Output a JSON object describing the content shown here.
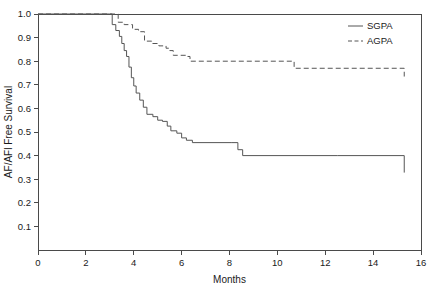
{
  "chart_data": {
    "type": "line",
    "title": "",
    "xlabel": "Months",
    "ylabel": "AF/AFl Free Survival",
    "xlim": [
      0,
      16
    ],
    "ylim": [
      0,
      1.0
    ],
    "grid": false,
    "legend_position": "top-right",
    "xticks": [
      0,
      2,
      4,
      6,
      8,
      10,
      12,
      14,
      16
    ],
    "xtick_labels": [
      "0",
      "2",
      "4",
      "6",
      "8",
      "10",
      "12",
      "14",
      "16"
    ],
    "yticks": [
      0.1,
      0.2,
      0.3,
      0.4,
      0.5,
      0.6,
      0.7,
      0.8,
      0.9,
      1.0
    ],
    "ytick_labels": [
      "0.1",
      "0.2",
      "0.3",
      "0.4",
      "0.5",
      "0.6",
      "0.7",
      "0.8",
      "0.9",
      "1.0"
    ],
    "series": [
      {
        "name": "SGPA",
        "style": "solid",
        "color": "#555555",
        "x": [
          0,
          3.0,
          3.1,
          3.25,
          3.4,
          3.5,
          3.6,
          3.7,
          3.8,
          3.9,
          4.0,
          4.1,
          4.25,
          4.4,
          4.55,
          4.8,
          5.0,
          5.2,
          5.4,
          5.55,
          5.8,
          6.0,
          6.2,
          6.45,
          8.1,
          8.35,
          8.55,
          12.5,
          15.3
        ],
        "y": [
          1.0,
          1.0,
          0.955,
          0.93,
          0.905,
          0.875,
          0.845,
          0.82,
          0.775,
          0.73,
          0.695,
          0.665,
          0.635,
          0.605,
          0.575,
          0.565,
          0.55,
          0.545,
          0.525,
          0.505,
          0.495,
          0.475,
          0.465,
          0.455,
          0.455,
          0.425,
          0.4,
          0.4,
          0.328
        ]
      },
      {
        "name": "AGPA",
        "style": "dashed",
        "color": "#555555",
        "x": [
          0,
          3.05,
          3.35,
          3.6,
          3.95,
          4.2,
          4.45,
          4.75,
          5.05,
          5.35,
          5.5,
          5.65,
          6.2,
          6.35,
          8.05,
          10.7,
          15.3
        ],
        "y": [
          1.0,
          1.0,
          0.965,
          0.955,
          0.935,
          0.925,
          0.885,
          0.875,
          0.865,
          0.855,
          0.845,
          0.825,
          0.82,
          0.8,
          0.8,
          0.77,
          0.735
        ]
      }
    ]
  },
  "legend": {
    "entries": [
      {
        "label": "SGPA",
        "style": "solid"
      },
      {
        "label": "AGPA",
        "style": "dashed"
      }
    ]
  }
}
